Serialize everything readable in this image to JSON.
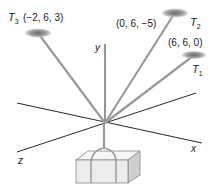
{
  "figure": {
    "type": "3d-force-diagram",
    "axes": {
      "x_label": "x",
      "y_label": "y",
      "z_label": "z"
    },
    "anchors": [
      {
        "name": "T",
        "subscript": "3",
        "coords": "(−2, 6, 3)"
      },
      {
        "name": "T",
        "subscript": "2",
        "coords": "(0, 6, −5)"
      },
      {
        "name": "T",
        "subscript": "1",
        "coords": "(6, 6, 0)"
      }
    ],
    "object": "suspended-box",
    "colors": {
      "axis": "#2a2a2a",
      "rope": "#9a9a9a",
      "anchor_disk": "#8a8a8a",
      "box_front": "#ececec",
      "box_top": "#f6f6f6",
      "box_side": "#cfcfcf",
      "box_edge": "#888888"
    }
  }
}
